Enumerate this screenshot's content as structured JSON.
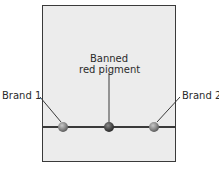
{
  "diagram": {
    "labels": {
      "brand1": "Brand 1",
      "banned_line1": "Banned",
      "banned_line2": "red pigment",
      "brand2": "Brand 2"
    },
    "spots": [
      {
        "name": "brand-1-spot",
        "x": 63,
        "color": "#8a8a8a"
      },
      {
        "name": "banned-red-pigment-spot",
        "x": 109,
        "color": "#4a4a4a"
      },
      {
        "name": "brand-2-spot",
        "x": 154,
        "color": "#8a8a8a"
      }
    ],
    "colors": {
      "frame_border": "#3a3a3a",
      "frame_fill": "#ececec",
      "leader_line": "#3a3a3a"
    }
  }
}
